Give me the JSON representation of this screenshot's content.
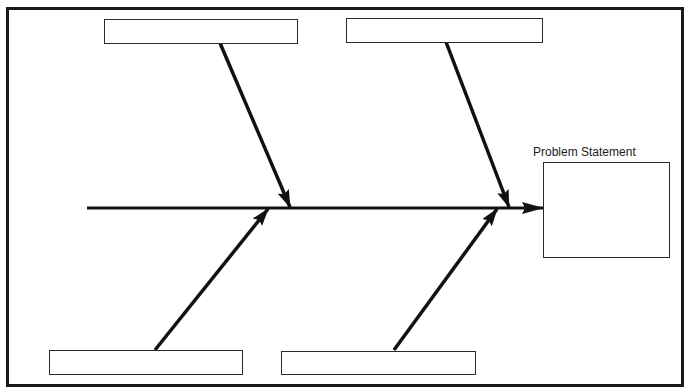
{
  "diagram": {
    "type": "fishbone",
    "header": {
      "title": ""
    },
    "problem": {
      "label": "Problem Statement",
      "value": ""
    },
    "causes": [
      {
        "id": "top-left",
        "label": ""
      },
      {
        "id": "top-right",
        "label": ""
      },
      {
        "id": "bottom-left",
        "label": ""
      },
      {
        "id": "bottom-right",
        "label": ""
      }
    ],
    "colors": {
      "line": "#111111",
      "border": "#1a1a1a",
      "background": "#ffffff"
    }
  }
}
